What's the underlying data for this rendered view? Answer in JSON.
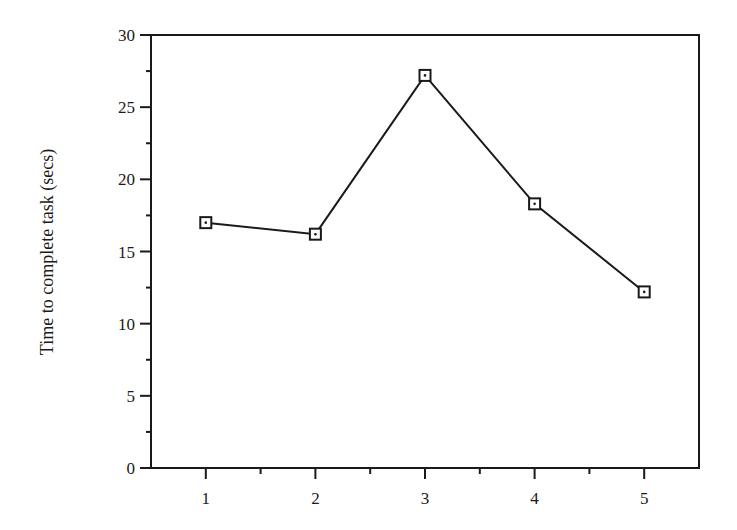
{
  "chart_data": {
    "type": "line",
    "title": "",
    "xlabel": "",
    "ylabel": "Time to complete task (secs)",
    "categories": [
      "1",
      "2",
      "3",
      "4",
      "5"
    ],
    "x": [
      1,
      2,
      3,
      4,
      5
    ],
    "series": [
      {
        "name": "Time to complete task",
        "values": [
          17.0,
          16.2,
          27.2,
          18.3,
          12.2
        ],
        "marker": "square-dot",
        "color": "#1a1a1a"
      }
    ],
    "ylim": [
      0,
      30
    ],
    "yticks": [
      0,
      5,
      10,
      15,
      20,
      25,
      30
    ],
    "yminor_step": 2.5,
    "xlim": [
      0.5,
      5.5
    ],
    "grid": false,
    "legend": null
  },
  "colors": {
    "line": "#1a1a1a",
    "background": "#ffffff"
  }
}
